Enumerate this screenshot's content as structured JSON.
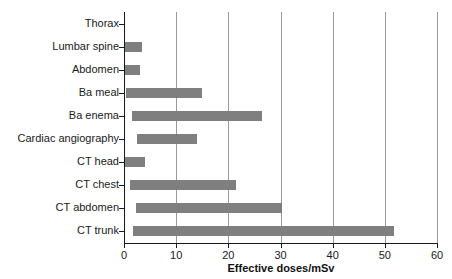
{
  "chart_data": {
    "type": "bar",
    "orientation": "horizontal",
    "bar_style": "floating-range",
    "title": "",
    "xlabel": "Effective doses/mSv",
    "ylabel": "",
    "xlim": [
      0,
      60
    ],
    "xticks": [
      0,
      10,
      20,
      30,
      40,
      50,
      60
    ],
    "xtick_labels": [
      "0",
      "10",
      "20",
      "30",
      "40",
      "50",
      "60"
    ],
    "grid": "vertical",
    "legend": "none",
    "bar_color": "#7f7f7f",
    "axis_color": "#1a1a1a",
    "gridline_color": "#9a9a9a",
    "categories": [
      "Thorax",
      "Lumbar spine",
      "Abdomen",
      "Ba meal",
      "Ba enema",
      "Cardiac angiography",
      "CT head",
      "CT chest",
      "CT abdomen",
      "CT trunk"
    ],
    "ranges": [
      {
        "category": "Thorax",
        "low": 0.0,
        "high": 0.2
      },
      {
        "category": "Lumbar spine",
        "low": 0.0,
        "high": 3.4
      },
      {
        "category": "Abdomen",
        "low": 0.0,
        "high": 3.1
      },
      {
        "category": "Ba meal",
        "low": 0.4,
        "high": 15.0
      },
      {
        "category": "Ba enema",
        "low": 1.5,
        "high": 26.5
      },
      {
        "category": "Cardiac angiography",
        "low": 2.5,
        "high": 14.0
      },
      {
        "category": "CT head",
        "low": 0.0,
        "high": 4.0
      },
      {
        "category": "CT chest",
        "low": 1.1,
        "high": 21.5
      },
      {
        "category": "CT abdomen",
        "low": 2.3,
        "high": 30.3
      },
      {
        "category": "CT trunk",
        "low": 1.7,
        "high": 51.7
      }
    ]
  }
}
